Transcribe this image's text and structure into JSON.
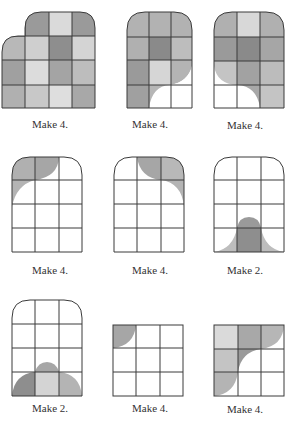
{
  "colors": {
    "line": "#3a3a3a",
    "dark": "#8c8c8c",
    "mid": "#a9a9a9",
    "light": "#c4c4c4",
    "pale": "#dcdcdc",
    "white": "#ffffff"
  },
  "figures": [
    {
      "id": "fig1",
      "label": "Make 4.",
      "x": 0,
      "y": 0,
      "label_y": 118
    },
    {
      "id": "fig2",
      "label": "Make 4.",
      "x": 100,
      "y": 0,
      "label_y": 118
    },
    {
      "id": "fig3",
      "label": "Make 4.",
      "x": 197,
      "y": 0,
      "label_y": 119
    },
    {
      "id": "fig4",
      "label": "Make 4.",
      "x": 0,
      "y": 145,
      "label_y": 119
    },
    {
      "id": "fig5",
      "label": "Make 4.",
      "x": 100,
      "y": 145,
      "label_y": 119
    },
    {
      "id": "fig6",
      "label": "Make 2.",
      "x": 197,
      "y": 145,
      "label_y": 119
    },
    {
      "id": "fig7",
      "label": "Make 2.",
      "x": 0,
      "y": 290,
      "label_y": 112
    },
    {
      "id": "fig8",
      "label": "Make 4.",
      "x": 100,
      "y": 290,
      "label_y": 112
    },
    {
      "id": "fig9",
      "label": "Make 4.",
      "x": 197,
      "y": 290,
      "label_y": 113
    }
  ]
}
